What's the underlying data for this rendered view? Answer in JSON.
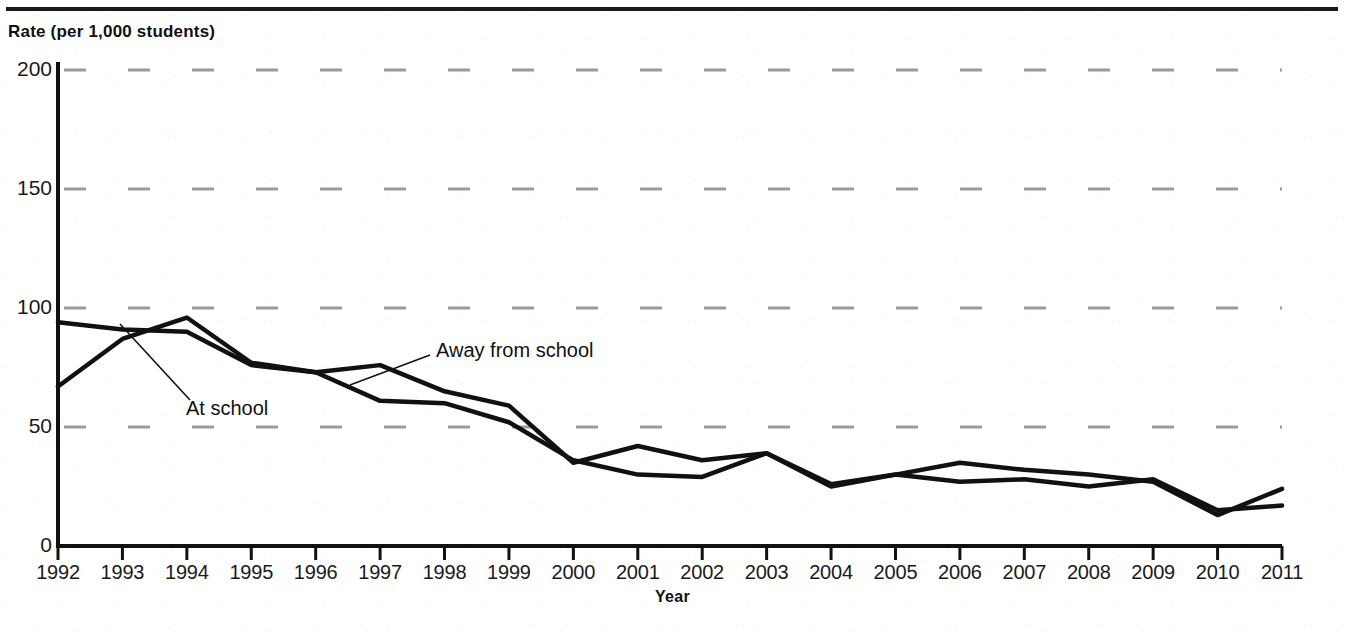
{
  "figure": {
    "title_fragment": "",
    "y_axis_label": "Rate (per 1,000 students)",
    "x_axis_title": "Year"
  },
  "labels": {
    "at_school": "At school",
    "away_from_school": "Away from school"
  },
  "chart_data": {
    "type": "line",
    "xlabel": "Year",
    "ylabel": "Rate (per 1,000 students)",
    "ylim": [
      0,
      200
    ],
    "yticks": [
      0,
      50,
      100,
      150,
      200
    ],
    "grid": "horizontal dashed gray",
    "legend": "inline annotations with leader lines",
    "categories": [
      "1992",
      "1993",
      "1994",
      "1995",
      "1996",
      "1997",
      "1998",
      "1999",
      "2000",
      "2001",
      "2002",
      "2003",
      "2004",
      "2005",
      "2006",
      "2007",
      "2008",
      "2009",
      "2010",
      "2011"
    ],
    "x": [
      1992,
      1993,
      1994,
      1995,
      1996,
      1997,
      1998,
      1999,
      2000,
      2001,
      2002,
      2003,
      2004,
      2005,
      2006,
      2007,
      2008,
      2009,
      2010,
      2011
    ],
    "series": [
      {
        "name": "At school",
        "values": [
          94,
          91,
          90,
          76,
          73,
          61,
          60,
          52,
          36,
          30,
          29,
          39,
          25,
          30,
          27,
          28,
          25,
          28,
          15,
          17
        ]
      },
      {
        "name": "Away from school",
        "values": [
          67,
          87,
          96,
          77,
          73,
          76,
          65,
          59,
          35,
          42,
          36,
          39,
          26,
          30,
          35,
          32,
          30,
          27,
          13,
          24
        ]
      }
    ]
  },
  "ticks": {
    "y": [
      "200",
      "150",
      "100",
      "50",
      "0"
    ]
  }
}
